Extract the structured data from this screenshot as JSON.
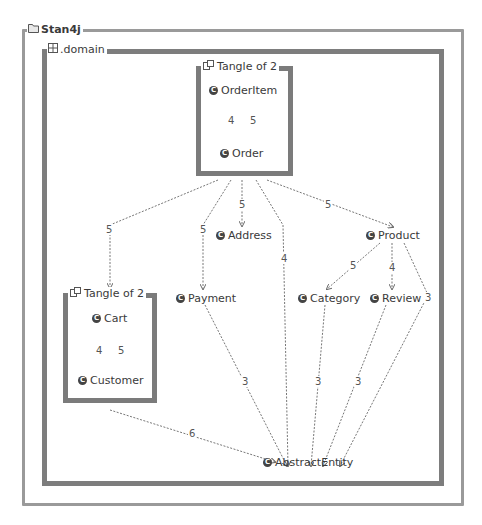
{
  "outer_frame": {
    "title": "Stan4j",
    "icon": "folder-icon"
  },
  "inner_frame": {
    "title": ".domain",
    "icon": "package-icon"
  },
  "tangles": [
    {
      "title": "Tangle of 2",
      "icon": "tangle-icon",
      "nodes": [
        "OrderItem",
        "Order"
      ],
      "up_weight": "4",
      "down_weight": "5"
    },
    {
      "title": "Tangle of 2",
      "icon": "tangle-icon",
      "nodes": [
        "Cart",
        "Customer"
      ],
      "up_weight": "4",
      "down_weight": "5"
    }
  ],
  "nodes": {
    "address": "Address",
    "payment": "Payment",
    "product": "Product",
    "category": "Category",
    "review": "Review",
    "abstract_entity": "AbstractEntity"
  },
  "edges": [
    {
      "from": "Tangle(Order)",
      "to": "Tangle(Cart)",
      "weight": "5"
    },
    {
      "from": "Tangle(Order)",
      "to": "Payment",
      "weight": "5"
    },
    {
      "from": "Tangle(Order)",
      "to": "Address",
      "weight": "5"
    },
    {
      "from": "Tangle(Order)",
      "to": "AbstractEntity",
      "weight": "4"
    },
    {
      "from": "Tangle(Order)",
      "to": "Product",
      "weight": "5"
    },
    {
      "from": "Product",
      "to": "Category",
      "weight": "5"
    },
    {
      "from": "Product",
      "to": "Review",
      "weight": "4"
    },
    {
      "from": "Product",
      "to": "AbstractEntity",
      "weight": "3"
    },
    {
      "from": "Payment",
      "to": "AbstractEntity",
      "weight": "3"
    },
    {
      "from": "Category",
      "to": "AbstractEntity",
      "weight": "3"
    },
    {
      "from": "Review",
      "to": "AbstractEntity",
      "weight": "3"
    },
    {
      "from": "Tangle(Cart)",
      "to": "AbstractEntity",
      "weight": "6"
    }
  ],
  "colors": {
    "outer_border": "#9a9a9a",
    "inner_border": "#7d7d7d",
    "edge": "#707070"
  }
}
